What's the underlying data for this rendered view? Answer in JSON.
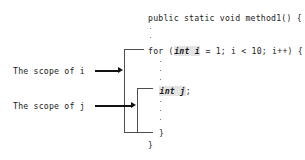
{
  "diagram": {
    "code": {
      "method_signature": "public static void method1() {",
      "for_prefix": "for (",
      "for_decl": "int i",
      "for_suffix": " = 1; i < 10; i++) {",
      "inner_decl": "int j",
      "inner_suffix": ";",
      "close_inner": "}",
      "close_outer": "}"
    },
    "labels": {
      "scope_i": "The scope of i",
      "scope_j": "The scope of j"
    },
    "ellipsis": {
      "glyph": "·",
      "group_after_signature": 2,
      "group_after_for": 3,
      "group_after_decl": 3
    },
    "colors": {
      "text": "#1b1b1b",
      "bracket": "#4d4d4d",
      "arrow": "#111111",
      "highlight": "#e4e4e4",
      "background": "#ffffff"
    },
    "icons": {
      "arrow_i": "arrow-right-icon",
      "arrow_j": "arrow-right-icon",
      "bracket_i": "scope-bracket-icon",
      "bracket_j": "scope-bracket-icon"
    }
  }
}
